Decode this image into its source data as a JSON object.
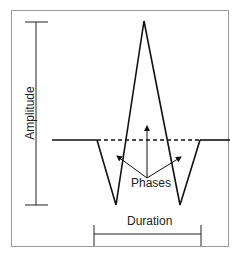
{
  "diagram": {
    "labels": {
      "amplitude": "Amplitude",
      "phases": "Phases",
      "duration": "Duration"
    },
    "colors": {
      "line": "#111111",
      "frame": "#9a9a9a"
    }
  }
}
